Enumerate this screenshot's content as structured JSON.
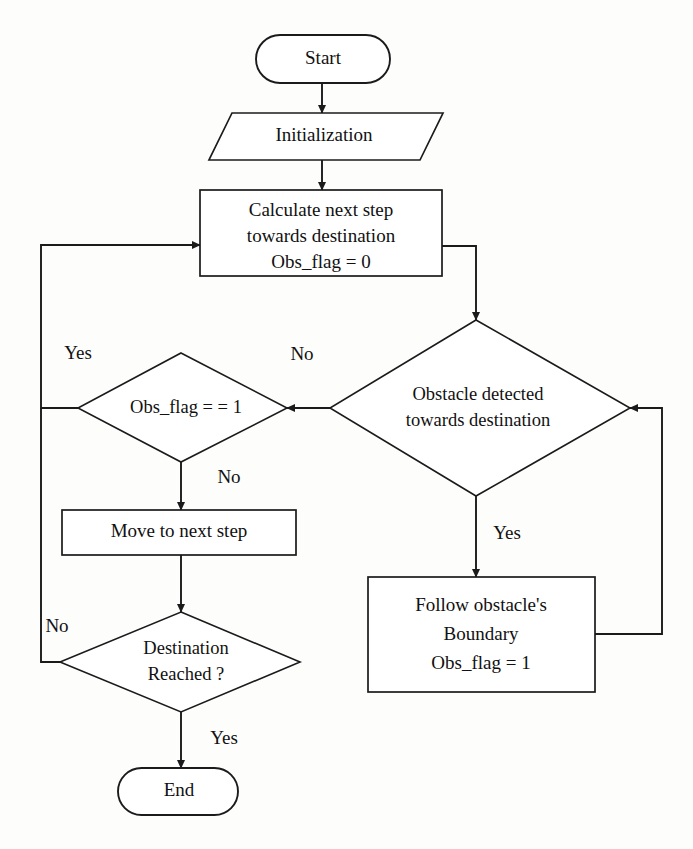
{
  "diagram": {
    "colors": {
      "stroke": "#1b1b1b",
      "fill": "#ffffff",
      "background": "#fdfdfc",
      "text": "#111111"
    },
    "nodes": {
      "start": {
        "type": "terminator",
        "label": "Start"
      },
      "initialization": {
        "type": "io-parallelogram",
        "label": "Initialization"
      },
      "calculate": {
        "type": "process",
        "line1": "Calculate next step",
        "line2": "towards destination",
        "line3": "Obs_flag = 0"
      },
      "obstacle_detected": {
        "type": "decision",
        "line1": "Obstacle detected",
        "line2": "towards destination"
      },
      "obs_flag_check": {
        "type": "decision",
        "label": "Obs_flag = = 1"
      },
      "move_next": {
        "type": "process",
        "label": "Move to next step"
      },
      "follow_boundary": {
        "type": "process",
        "line1": "Follow obstacle's",
        "line2": "Boundary",
        "line3": "Obs_flag = 1"
      },
      "destination_reached": {
        "type": "decision",
        "line1": "Destination",
        "line2": "Reached ?"
      },
      "end": {
        "type": "terminator",
        "label": "End"
      }
    },
    "edge_labels": {
      "obstacle_no": "No",
      "obstacle_yes": "Yes",
      "obsflag_yes": "Yes",
      "obsflag_no": "No",
      "destination_no": "No",
      "destination_yes": "Yes"
    }
  }
}
